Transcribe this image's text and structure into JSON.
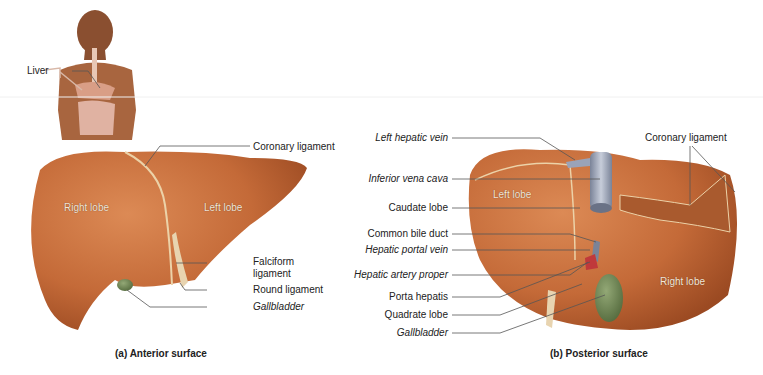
{
  "figure": {
    "body_inset": {
      "label": "Liver"
    },
    "anterior": {
      "caption": "(a) Anterior surface",
      "lobes": {
        "right": "Right lobe",
        "left": "Left lobe"
      },
      "labels": {
        "coronary": "Coronary ligament",
        "falciform_1": "Falciform",
        "falciform_2": "ligament",
        "round": "Round ligament",
        "gallbladder": "Gallbladder"
      }
    },
    "posterior": {
      "caption": "(b) Posterior surface",
      "lobes": {
        "left": "Left lobe",
        "right": "Right lobe"
      },
      "labels": {
        "left_hepatic_vein": "Left hepatic vein",
        "ivc": "Inferior vena cava",
        "caudate": "Caudate lobe",
        "bile_duct": "Common bile duct",
        "portal_vein": "Hepatic portal vein",
        "artery": "Hepatic artery proper",
        "porta": "Porta hepatis",
        "quadrate": "Quadrate lobe",
        "gallbladder": "Gallbladder",
        "coronary": "Coronary ligament"
      }
    },
    "colors": {
      "liver": "#c8703e",
      "liver_dark": "#9e4f26",
      "gallbladder": "#6f8a55",
      "ivc": "#9aa3b8",
      "line": "#555555"
    }
  }
}
